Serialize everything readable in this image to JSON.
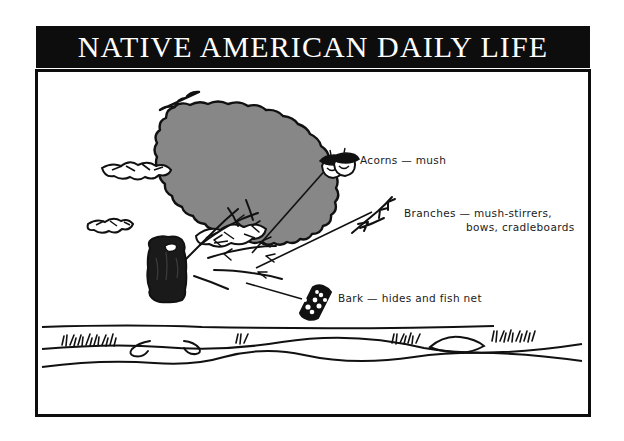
{
  "poster": {
    "title": "NATIVE AMERICAN DAILY LIFE",
    "frame_color": "#0d0d0d",
    "header_bg": "#0d0d0d",
    "header_text_color": "#ffffff",
    "panel_bg": "#ffffff",
    "canopy_fill": "#878787",
    "ink_color": "#111111"
  },
  "illustration": {
    "subject": "oak-tree",
    "ground_label": "ground-line",
    "trunk_label": "tree-trunk",
    "canopy_label": "tree-canopy"
  },
  "callouts": [
    {
      "id": "acorns",
      "icon": "acorns-icon",
      "text": "Acorns — mush",
      "lines": [
        "Acorns — mush"
      ]
    },
    {
      "id": "branches",
      "icon": "branch-icon",
      "text": "Branches — mush-stirrers, bows, cradleboards",
      "lines": [
        "Branches — mush-stirrers,",
        "bows, cradleboards"
      ]
    },
    {
      "id": "bark",
      "icon": "bark-icon",
      "text": "Bark — hides and fish net",
      "lines": [
        "Bark — hides and fish net"
      ]
    }
  ]
}
